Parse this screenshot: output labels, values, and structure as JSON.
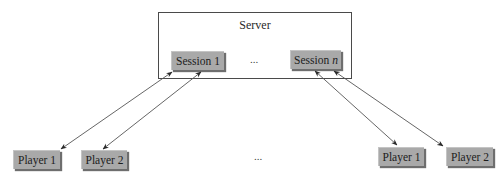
{
  "server": {
    "label": "Server",
    "sessions": [
      {
        "prefix": "Session ",
        "suffix": "1",
        "suffix_italic": false
      },
      {
        "prefix": "Session ",
        "suffix": "n",
        "suffix_italic": true
      }
    ],
    "session_ellipsis": "..."
  },
  "players": [
    {
      "label": "Player 1",
      "session": 0
    },
    {
      "label": "Player 2",
      "session": 0
    },
    {
      "label": "Player 1",
      "session": 1
    },
    {
      "label": "Player 2",
      "session": 1
    }
  ],
  "player_ellipsis": "...",
  "colors": {
    "node_fill": "#a9a9a9",
    "line": "#555555",
    "border": "#4a4a4a"
  },
  "connections": [
    {
      "from": "session-1",
      "to": "player-1-left",
      "type": "bidirectional"
    },
    {
      "from": "session-1",
      "to": "player-2-left",
      "type": "bidirectional"
    },
    {
      "from": "session-n",
      "to": "player-1-right",
      "type": "bidirectional"
    },
    {
      "from": "session-n",
      "to": "player-2-right",
      "type": "bidirectional"
    }
  ]
}
